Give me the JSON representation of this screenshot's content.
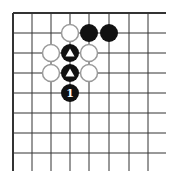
{
  "diagram": {
    "type": "go-board-fragment",
    "grid": {
      "x_lines": [
        13,
        32,
        51,
        70,
        89,
        109,
        129,
        148
      ],
      "y_lines": [
        13,
        33,
        53,
        73,
        93,
        113,
        133,
        153
      ],
      "right_extent": 166,
      "bottom_extent": 171,
      "edges": [
        "top",
        "left"
      ],
      "line_color": "#333333"
    },
    "stones": [
      {
        "color": "white",
        "col": 3,
        "row": 1
      },
      {
        "color": "black",
        "col": 4,
        "row": 1
      },
      {
        "color": "black",
        "col": 5,
        "row": 1
      },
      {
        "color": "white",
        "col": 2,
        "row": 2
      },
      {
        "color": "black",
        "col": 3,
        "row": 2,
        "mark": "triangle"
      },
      {
        "color": "white",
        "col": 4,
        "row": 2
      },
      {
        "color": "white",
        "col": 2,
        "row": 3
      },
      {
        "color": "black",
        "col": 3,
        "row": 3,
        "mark": "triangle"
      },
      {
        "color": "white",
        "col": 4,
        "row": 3
      },
      {
        "color": "black",
        "col": 3,
        "row": 4,
        "label": "1"
      }
    ],
    "colors": {
      "black_stone": "#111111",
      "white_stone_fill": "#ffffff",
      "white_stone_stroke": "#9a9a9a",
      "mark": "#ffffff"
    }
  }
}
